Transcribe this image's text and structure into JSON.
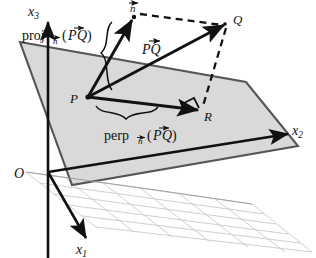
{
  "figure": {
    "type": "vector-projection-diagram",
    "background_color": "#ffffff",
    "ink_color": "#111111",
    "plane_fill_color": "#d6d6d6",
    "plane_edge_color": "#555555",
    "grid_color": "#c9c9c9"
  },
  "axes": {
    "x1": {
      "label": "x",
      "subscript": "1",
      "label_text": "x₁"
    },
    "x2": {
      "label": "x",
      "subscript": "2",
      "label_text": "x₂"
    },
    "x3": {
      "label": "x",
      "subscript": "3",
      "label_text": "x₃"
    },
    "origin": {
      "label": "O"
    }
  },
  "points": {
    "P": {
      "label": "P",
      "x": 88,
      "y": 97
    },
    "Q": {
      "label": "Q",
      "x": 228,
      "y": 22
    },
    "R": {
      "label": "R",
      "x": 201,
      "y": 110
    },
    "N": {
      "label": "n",
      "accent": "vector-arrow",
      "label_text": "n⃗",
      "x": 133,
      "y": 14
    }
  },
  "vectors": [
    {
      "name": "normal-vector",
      "label": "n",
      "accent": "arrow",
      "from": "P",
      "to": "N",
      "style": "solid"
    },
    {
      "name": "pq-vector",
      "label": "PQ",
      "accent": "arrow",
      "label_text": "P⃗Q",
      "from": "P",
      "to": "Q",
      "style": "solid"
    },
    {
      "name": "pr-vector",
      "label": "perp",
      "from": "P",
      "to": "R",
      "style": "solid"
    }
  ],
  "dashed_connectors": [
    {
      "name": "n-to-q-dashed",
      "from": "N",
      "to": "Q"
    },
    {
      "name": "q-to-r-dashed",
      "from": "Q",
      "to": "R"
    }
  ],
  "annotations": {
    "proj": {
      "name": "projection-label",
      "prefix": "proj",
      "subscript": "n⃗",
      "argument": "(P⃗Q)",
      "full_text": "proj n⃗ (P⃗Q)",
      "x": 22,
      "y": 38
    },
    "perp": {
      "name": "perpendicular-label",
      "prefix": "perp",
      "subscript": "n⃗",
      "argument": "(P⃗Q)",
      "full_text": "perp n⃗ (P⃗Q)",
      "x": 104,
      "y": 136
    }
  },
  "markers": {
    "right_angle": {
      "name": "right-angle-marker",
      "at": "R",
      "description": "square right-angle symbol at R"
    }
  },
  "plane": {
    "name": "oblique-plane",
    "vertices": [
      {
        "x": 20,
        "y": 42
      },
      {
        "x": 246,
        "y": 82
      },
      {
        "x": 298,
        "y": 146
      },
      {
        "x": 72,
        "y": 185
      }
    ]
  },
  "ground_grid": {
    "name": "x1x2-ground-plane-grid",
    "rows": 5,
    "cols": 6
  }
}
